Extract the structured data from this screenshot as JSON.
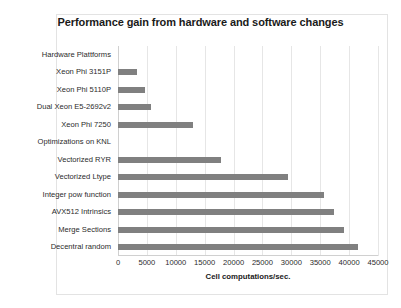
{
  "chart_data": {
    "type": "bar",
    "orientation": "horizontal",
    "title": "Performance gain from hardware and software changes",
    "xlabel": "Cell computations/sec.",
    "ylabel": "",
    "xlim": [
      0,
      45000
    ],
    "xticks": [
      "0",
      "5000",
      "10000",
      "15000",
      "20000",
      "25000",
      "30000",
      "35000",
      "40000",
      "45000"
    ],
    "xtick_values": [
      0,
      5000,
      10000,
      15000,
      20000,
      25000,
      30000,
      35000,
      40000,
      45000
    ],
    "grid": "vertical",
    "legend": "none",
    "bar_color": "#808080",
    "categories": [
      "Hardware Plattforms",
      "Xeon Phi 3151P",
      "Xeon Phi 5110P",
      "Dual Xeon E5-2692v2",
      "Xeon Phi 7250",
      "Optimizations on KNL",
      "Vectorized RYR",
      "Vectorized Ltype",
      "Integer pow function",
      "AVX512 Intrinsics",
      "Merge Sections",
      "Decentral random"
    ],
    "values": [
      0,
      3300,
      4700,
      5700,
      13000,
      0,
      17900,
      29500,
      35600,
      37400,
      39200,
      41500
    ]
  }
}
